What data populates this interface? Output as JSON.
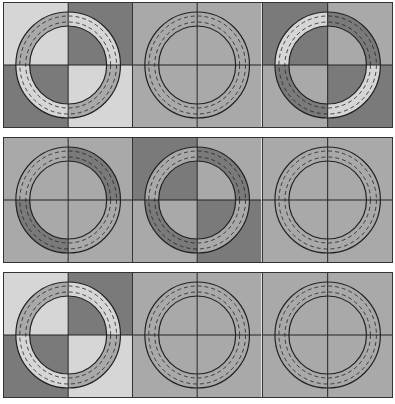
{
  "colors": {
    "light": "#d6d6d6",
    "mid": "#a9a9a9",
    "dark": "#7a7a7a",
    "line": "#222222"
  },
  "rows": [
    {
      "tiles": [
        {
          "quadrants": [
            "light",
            "dark",
            "dark",
            "light"
          ],
          "ring": [
            "mid",
            "light",
            "light",
            "mid"
          ]
        },
        {
          "quadrants": [
            "mid",
            "mid",
            "mid",
            "mid"
          ],
          "ring": [
            "mid",
            "mid",
            "mid",
            "mid"
          ]
        },
        {
          "quadrants": [
            "dark",
            "mid",
            "mid",
            "dark"
          ],
          "ring": [
            "light",
            "dark",
            "dark",
            "light"
          ]
        }
      ]
    },
    {
      "tiles": [
        {
          "quadrants": [
            "mid",
            "mid",
            "mid",
            "mid"
          ],
          "ring": [
            "mid",
            "dark",
            "dark",
            "mid"
          ]
        },
        {
          "quadrants": [
            "dark",
            "mid",
            "mid",
            "dark"
          ],
          "ring": [
            "mid",
            "dark",
            "dark",
            "mid"
          ]
        },
        {
          "quadrants": [
            "mid",
            "mid",
            "mid",
            "mid"
          ],
          "ring": [
            "mid",
            "mid",
            "mid",
            "mid"
          ]
        }
      ]
    },
    {
      "tiles": [
        {
          "quadrants": [
            "light",
            "dark",
            "dark",
            "light"
          ],
          "ring": [
            "mid",
            "light",
            "light",
            "mid"
          ]
        },
        {
          "quadrants": [
            "mid",
            "mid",
            "mid",
            "mid"
          ],
          "ring": [
            "mid",
            "mid",
            "mid",
            "mid"
          ]
        },
        {
          "quadrants": [
            "mid",
            "mid",
            "mid",
            "mid"
          ],
          "ring": [
            "mid",
            "mid",
            "mid",
            "mid"
          ]
        }
      ]
    }
  ]
}
